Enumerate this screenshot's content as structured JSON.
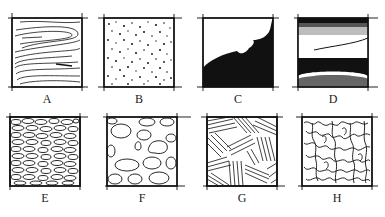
{
  "figure": {
    "panels": [
      {
        "label": "A",
        "texture": "wood-grain"
      },
      {
        "label": "B",
        "texture": "stippled-dots"
      },
      {
        "label": "C",
        "texture": "solid-black-wave"
      },
      {
        "label": "D",
        "texture": "horizontal-bands-tonal"
      },
      {
        "label": "E",
        "texture": "small-pebbles-dense"
      },
      {
        "label": "F",
        "texture": "large-pebbles-outline"
      },
      {
        "label": "G",
        "texture": "crosshatch-strokes"
      },
      {
        "label": "H",
        "texture": "squiggle-network"
      }
    ]
  },
  "colors": {
    "ink": "#111111",
    "gray": "#888888",
    "light_gray": "#c8c8c8",
    "background": "#ffffff"
  }
}
